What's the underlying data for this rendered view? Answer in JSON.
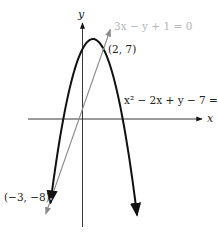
{
  "chart_data": {
    "type": "line",
    "title": "",
    "xlabel": "x",
    "ylabel": "y",
    "grid": false,
    "series": [
      {
        "name": "x^2 - 2x + y - 7 = 0",
        "kind": "parabola",
        "equation": "y = -x^2 + 2x + 7",
        "vertex": [
          1,
          8
        ],
        "color": "#111111",
        "x_range": [
          -3.05,
          5.2
        ]
      },
      {
        "name": "3x - y + 1 = 0",
        "kind": "line",
        "equation": "y = 3x + 1",
        "color": "#8a8a8a",
        "x_range": [
          -3.5,
          2.65
        ]
      }
    ],
    "points": [
      {
        "label": "(2, 7)",
        "x": 2,
        "y": 7
      },
      {
        "label": "(−3, −8)",
        "x": -3,
        "y": -8
      }
    ],
    "labels": {
      "parabola_eq": "x² − 2x + y − 7 = 0",
      "line_eq": "3x − y + 1 = 0",
      "point_upper": "(2, 7)",
      "point_lower": "(−3, −8)",
      "x_axis": "x",
      "y_axis": "y"
    },
    "axes": {
      "origin_px": [
        82.5,
        119
      ],
      "scale_px": [
        10.5,
        10
      ]
    }
  }
}
